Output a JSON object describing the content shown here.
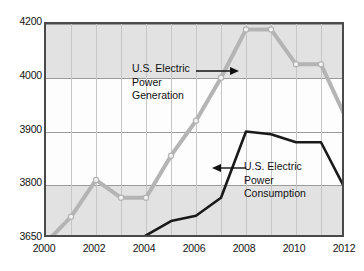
{
  "chart_data": {
    "type": "line",
    "title": "",
    "xlabel": "",
    "ylabel": "",
    "x": [
      2000,
      2001,
      2002,
      2003,
      2004,
      2005,
      2006,
      2007,
      2008,
      2009,
      2010,
      2011,
      2012
    ],
    "xlim": [
      2000,
      2012
    ],
    "ylim": [
      3650,
      4200
    ],
    "y_ticks": [
      3650,
      3800,
      3900,
      4000,
      4200
    ],
    "y_tick_labels": [
      "3650",
      "3800",
      "3900",
      "4000",
      "4200"
    ],
    "x_ticks": [
      2000,
      2002,
      2004,
      2006,
      2008,
      2010,
      2012
    ],
    "x_tick_labels": [
      "2000",
      "2002",
      "2004",
      "2006",
      "2008",
      "2010",
      "2012"
    ],
    "grid": true,
    "legend": "none",
    "shaded_bands": [
      [
        3650,
        3800
      ],
      [
        4000,
        4200
      ]
    ],
    "series": [
      {
        "name": "U.S. Electric Power Generation",
        "color": "#b4b4b4",
        "marker": "circle",
        "values": [
          3640,
          3712,
          3810,
          3765,
          3765,
          3855,
          3920,
          4000,
          4180,
          4180,
          4050,
          4050,
          3925
        ]
      },
      {
        "name": "U.S. Electric Power Consumption",
        "color": "#1a1a1a",
        "marker": "none",
        "values": [
          3570,
          3595,
          3632,
          3615,
          3660,
          3700,
          3715,
          3765,
          3900,
          3895,
          3880,
          3880,
          3785
        ]
      }
    ],
    "annotations": [
      {
        "id": "generation",
        "lines": [
          "U.S. Electric",
          "Power",
          "Generation"
        ],
        "arrow_direction": "right"
      },
      {
        "id": "consumption",
        "lines": [
          "U.S. Electric",
          "Power",
          "Consumption"
        ],
        "arrow_direction": "left"
      }
    ]
  },
  "colors": {
    "generation_line": "#b4b4b4",
    "consumption_line": "#1a1a1a",
    "band_fill": "#e2e2e2",
    "frame": "#4a4a4a",
    "gridline": "#9a9a9a",
    "vgridline": "#c6c6c6",
    "text": "#141414",
    "background": "#ffffff"
  }
}
